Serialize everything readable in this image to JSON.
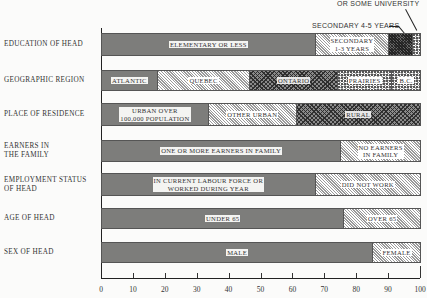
{
  "chart_data": {
    "type": "bar",
    "orientation": "horizontal-stacked-100",
    "title": "",
    "xlabel": "",
    "ylabel": "",
    "xlim": [
      0,
      100
    ],
    "x_ticks": [
      0,
      10,
      20,
      30,
      40,
      50,
      60,
      70,
      80,
      90,
      100
    ],
    "annotations": [
      "OR SOME UNIVERSITY",
      "SECONDARY 4-5 YEARS"
    ],
    "rows": [
      {
        "category": "EDUCATION OF HEAD",
        "segments": [
          {
            "label": "ELEMENTARY OR LESS",
            "value": 67,
            "pattern": "solid"
          },
          {
            "label": "SECONDARY 1-3 YEARS",
            "value": 23,
            "pattern": "diag"
          },
          {
            "label": "SECONDARY 4-5 YEARS",
            "value": 7.5,
            "pattern": "dense",
            "external_label": true
          },
          {
            "label": "UNIVERSITY DEGREE OR SOME UNIVERSITY",
            "value": 2.5,
            "pattern": "speck",
            "external_label": true
          }
        ]
      },
      {
        "category": "GEOGRAPHIC REGION",
        "segments": [
          {
            "label": "ATLANTIC",
            "value": 17.5,
            "pattern": "solid"
          },
          {
            "label": "QUEBEC",
            "value": 29,
            "pattern": "diag"
          },
          {
            "label": "ONTARIO",
            "value": 27.5,
            "pattern": "cross"
          },
          {
            "label": "PRAIRIES",
            "value": 17,
            "pattern": "speck"
          },
          {
            "label": "B.C.",
            "value": 9,
            "pattern": "speck"
          }
        ]
      },
      {
        "category": "PLACE OF RESIDENCE",
        "segments": [
          {
            "label": "URBAN OVER 100,000 POPULATION",
            "value": 33.5,
            "pattern": "solid"
          },
          {
            "label": "OTHER URBAN",
            "value": 27.5,
            "pattern": "diag"
          },
          {
            "label": "RURAL",
            "value": 39,
            "pattern": "cross"
          }
        ]
      },
      {
        "category": "EARNERS IN THE FAMILY",
        "segments": [
          {
            "label": "ONE OR MORE EARNERS IN FAMILY",
            "value": 75,
            "pattern": "solid"
          },
          {
            "label": "NO EARNERS IN FAMILY",
            "value": 25,
            "pattern": "diag"
          }
        ]
      },
      {
        "category": "EMPLOYMENT STATUS OF HEAD",
        "segments": [
          {
            "label": "IN CURRENT LABOUR FORCE OR WORKED DURING YEAR",
            "value": 67,
            "pattern": "solid"
          },
          {
            "label": "DID NOT WORK",
            "value": 33,
            "pattern": "diag"
          }
        ]
      },
      {
        "category": "AGE OF HEAD",
        "segments": [
          {
            "label": "UNDER 65",
            "value": 76,
            "pattern": "solid"
          },
          {
            "label": "OVER 65",
            "value": 24,
            "pattern": "diag"
          }
        ]
      },
      {
        "category": "SEX OF HEAD",
        "segments": [
          {
            "label": "MALE",
            "value": 85,
            "pattern": "solid"
          },
          {
            "label": "FEMALE",
            "value": 15,
            "pattern": "diag"
          }
        ]
      }
    ]
  },
  "labels": {
    "rows": [
      {
        "line1": "EDUCATION OF HEAD",
        "line2": ""
      },
      {
        "line1": "GEOGRAPHIC REGION",
        "line2": ""
      },
      {
        "line1": "PLACE OF RESIDENCE",
        "line2": ""
      },
      {
        "line1": "EARNERS IN",
        "line2": "THE FAMILY"
      },
      {
        "line1": "EMPLOYMENT STATUS",
        "line2": "OF HEAD"
      },
      {
        "line1": "AGE OF HEAD",
        "line2": ""
      },
      {
        "line1": "SEX OF HEAD",
        "line2": ""
      }
    ],
    "segments": [
      [
        {
          "l1": "ELEMENTARY OR LESS",
          "l2": ""
        },
        {
          "l1": "SECONDARY",
          "l2": "1-3 YEARS"
        },
        {
          "l1": "",
          "l2": ""
        },
        {
          "l1": "",
          "l2": ""
        }
      ],
      [
        {
          "l1": "ATLANTIC",
          "l2": ""
        },
        {
          "l1": "QUEBEC",
          "l2": ""
        },
        {
          "l1": "ONTARIO",
          "l2": ""
        },
        {
          "l1": "PRAIRIES",
          "l2": ""
        },
        {
          "l1": "B.C.",
          "l2": ""
        }
      ],
      [
        {
          "l1": "URBAN OVER",
          "l2": "100,000 POPULATION"
        },
        {
          "l1": "OTHER URBAN",
          "l2": ""
        },
        {
          "l1": "RURAL",
          "l2": ""
        }
      ],
      [
        {
          "l1": "ONE OR MORE EARNERS IN FAMILY",
          "l2": ""
        },
        {
          "l1": "NO EARNERS",
          "l2": "IN FAMILY"
        }
      ],
      [
        {
          "l1": "IN CURRENT LABOUR FORCE OR",
          "l2": "WORKED DURING YEAR"
        },
        {
          "l1": "DID NOT WORK",
          "l2": ""
        }
      ],
      [
        {
          "l1": "UNDER 65",
          "l2": ""
        },
        {
          "l1": "OVER 65",
          "l2": ""
        }
      ],
      [
        {
          "l1": "MALE",
          "l2": ""
        },
        {
          "l1": "FEMALE",
          "l2": ""
        }
      ]
    ],
    "annot_university": "OR SOME UNIVERSITY",
    "annot_secondary45": "SECONDARY 4-5 YEARS",
    "ticks": [
      "0",
      "10",
      "20",
      "30",
      "40",
      "50",
      "60",
      "70",
      "80",
      "90",
      "100"
    ]
  }
}
